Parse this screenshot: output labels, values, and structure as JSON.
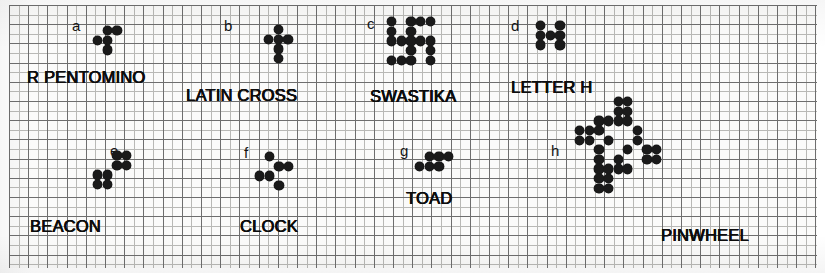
{
  "figure": {
    "paper_color": "#fbfbfa",
    "cell_color": "#1a1a1a",
    "grid_minor_color": "#b9b9b6",
    "grid_major_color": "#6e6e6e",
    "cell_size_px": 9.6
  },
  "patterns": [
    {
      "tag": "a",
      "name": "R PENTOMINO",
      "cells": [
        [
          0,
          1,
          1
        ],
        [
          1,
          1,
          0
        ],
        [
          0,
          1,
          0
        ]
      ],
      "cell_count": 5
    },
    {
      "tag": "b",
      "name": "LATIN CROSS",
      "cells": [
        [
          0,
          1,
          0
        ],
        [
          1,
          1,
          1
        ],
        [
          0,
          1,
          0
        ],
        [
          0,
          1,
          0
        ]
      ],
      "cell_count": 6
    },
    {
      "tag": "c",
      "name": "SWASTIKA",
      "cells": [
        [
          1,
          0,
          1,
          1,
          1
        ],
        [
          1,
          0,
          1,
          0,
          0
        ],
        [
          1,
          1,
          1,
          1,
          1
        ],
        [
          0,
          0,
          1,
          0,
          1
        ],
        [
          1,
          1,
          1,
          0,
          1
        ]
      ],
      "cell_count": 17
    },
    {
      "tag": "d",
      "name": "LETTER H",
      "cells": [
        [
          1,
          0,
          1
        ],
        [
          1,
          1,
          1
        ],
        [
          1,
          0,
          1
        ]
      ],
      "cell_count": 7
    },
    {
      "tag": "e",
      "name": "BEACON",
      "cells": [
        [
          0,
          0,
          1,
          1
        ],
        [
          0,
          0,
          1,
          1
        ],
        [
          1,
          1,
          0,
          0
        ],
        [
          1,
          1,
          0,
          0
        ]
      ],
      "cell_count": 8
    },
    {
      "tag": "f",
      "name": "CLOCK",
      "cells": [
        [
          0,
          1,
          0,
          0
        ],
        [
          0,
          0,
          1,
          1
        ],
        [
          1,
          1,
          0,
          0
        ],
        [
          0,
          0,
          1,
          0
        ]
      ],
      "cell_count": 6
    },
    {
      "tag": "g",
      "name": "TOAD",
      "cells": [
        [
          0,
          1,
          1,
          1
        ],
        [
          1,
          1,
          1,
          0
        ]
      ],
      "cell_count": 6
    },
    {
      "tag": "h",
      "name": "PINWHEEL",
      "cells": [
        [
          0,
          0,
          0,
          0,
          1,
          1,
          0,
          0,
          0,
          0
        ],
        [
          0,
          0,
          0,
          0,
          1,
          1,
          0,
          0,
          0,
          0
        ],
        [
          0,
          0,
          1,
          1,
          1,
          1,
          0,
          0,
          0,
          0
        ],
        [
          1,
          1,
          1,
          0,
          0,
          0,
          1,
          0,
          0,
          0
        ],
        [
          1,
          1,
          0,
          1,
          0,
          0,
          1,
          0,
          0,
          0
        ],
        [
          0,
          0,
          1,
          0,
          0,
          1,
          0,
          1,
          1,
          0
        ],
        [
          0,
          0,
          1,
          0,
          1,
          0,
          0,
          1,
          1,
          0
        ],
        [
          0,
          0,
          1,
          1,
          1,
          1,
          0,
          0,
          0,
          0
        ],
        [
          0,
          0,
          1,
          1,
          0,
          0,
          0,
          0,
          0,
          0
        ],
        [
          0,
          0,
          1,
          1,
          0,
          0,
          0,
          0,
          0,
          0
        ]
      ],
      "cell_count": 32
    }
  ]
}
